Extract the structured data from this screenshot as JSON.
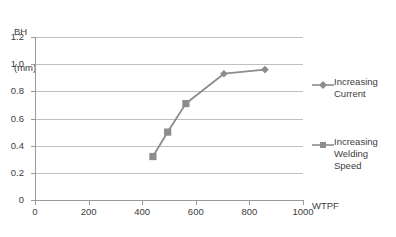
{
  "chart_data": {
    "type": "line",
    "title": "",
    "xlabel": "WTPF",
    "ylabel": "BH (mm)",
    "ylabel_line1": "BH",
    "ylabel_line2": "(mm)",
    "xlim": [
      0,
      1000
    ],
    "ylim": [
      0,
      1.2
    ],
    "grid": true,
    "legend_position": "right",
    "xticks": [
      "0",
      "200",
      "400",
      "600",
      "800",
      "1000"
    ],
    "xtick_values": [
      0,
      200,
      400,
      600,
      800,
      1000
    ],
    "yticks": [
      "0",
      "0.2",
      "0.4",
      "0.6",
      "0.8",
      "1.0",
      "1.2"
    ],
    "ytick_values": [
      0,
      0.2,
      0.4,
      0.6,
      0.8,
      1.0,
      1.2
    ],
    "series": [
      {
        "name": "Increasing Welding Speed",
        "marker": "square",
        "color": "#8c8c8c",
        "x": [
          440,
          495,
          563
        ],
        "y": [
          0.32,
          0.5,
          0.71
        ]
      },
      {
        "name": "Increasing Current",
        "marker": "diamond",
        "color": "#8c8c8c",
        "x": [
          705,
          858
        ],
        "y": [
          0.93,
          0.96
        ]
      }
    ],
    "connected_path": {
      "x": [
        440,
        495,
        563,
        705,
        858
      ],
      "y": [
        0.32,
        0.5,
        0.71,
        0.93,
        0.96
      ],
      "color": "#8c8c8c"
    },
    "colors": {
      "line": "#8c8c8c",
      "grid": "#bfbfbf",
      "axis": "#9a9a9a",
      "text": "#3d3d3d",
      "background": "#ffffff"
    }
  },
  "legend": {
    "entries": [
      {
        "label": "Increasing Current",
        "marker": "diamond"
      },
      {
        "label": "Increasing Welding Speed",
        "marker": "square"
      }
    ]
  }
}
